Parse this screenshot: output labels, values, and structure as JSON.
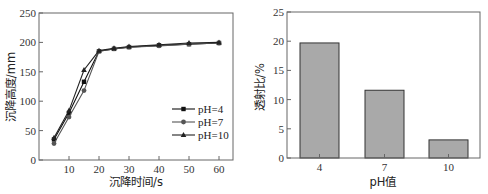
{
  "chart_data": [
    {
      "type": "line",
      "title": "",
      "xlabel": "沉降时间/s",
      "ylabel": "沉降高度/mm",
      "xlim": [
        0,
        65
      ],
      "ylim": [
        0,
        250
      ],
      "xticks": [
        10,
        20,
        30,
        40,
        50,
        60
      ],
      "yticks": [
        0,
        50,
        100,
        150,
        200,
        250
      ],
      "grid": false,
      "legend_position": "lower right",
      "x": [
        5,
        10,
        15,
        20,
        25,
        30,
        40,
        50,
        60
      ],
      "series": [
        {
          "name": "pH=4",
          "marker": "square",
          "values": [
            35,
            80,
            133,
            185,
            189,
            192,
            195,
            197,
            199
          ]
        },
        {
          "name": "pH=7",
          "marker": "circle",
          "values": [
            28,
            73,
            118,
            185,
            189,
            192,
            194,
            197,
            199
          ]
        },
        {
          "name": "pH=10",
          "marker": "triangle",
          "values": [
            38,
            84,
            153,
            186,
            190,
            193,
            196,
            199,
            200
          ]
        }
      ]
    },
    {
      "type": "bar",
      "title": "",
      "xlabel": "pH值",
      "ylabel": "透射比/%",
      "ylim": [
        0,
        25
      ],
      "yticks": [
        0,
        5,
        10,
        15,
        20,
        25
      ],
      "grid": false,
      "categories": [
        "4",
        "7",
        "10"
      ],
      "values": [
        19.7,
        11.6,
        3.1
      ],
      "bar_color": "#a9a9a9"
    }
  ],
  "left": {
    "ylabel": "沉降高度/mm",
    "xlabel": "沉降时间/s",
    "legend": [
      "pH=4",
      "pH=7",
      "pH=10"
    ]
  },
  "right": {
    "ylabel": "透射比/%",
    "xlabel": "pH值"
  }
}
